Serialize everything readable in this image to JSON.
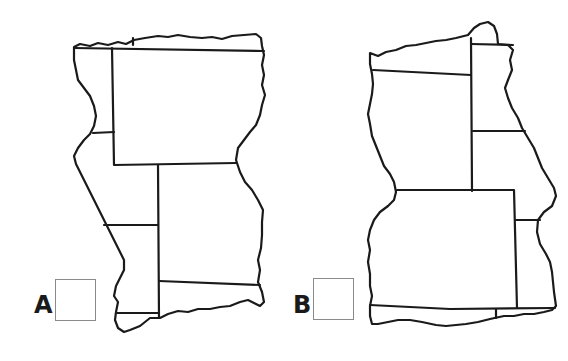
{
  "figure": {
    "options": [
      {
        "id": "A",
        "label": "A",
        "checked": false
      },
      {
        "id": "B",
        "label": "B",
        "checked": false
      }
    ],
    "colors": {
      "line": "#1a1a1a",
      "checkbox_border": "#8a8a8a",
      "background": "#ffffff"
    }
  }
}
